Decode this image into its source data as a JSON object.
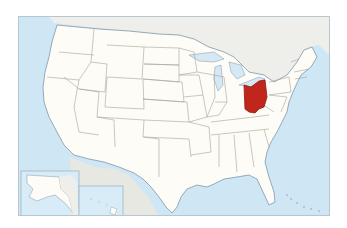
{
  "map": {
    "title": "Ohio in the United States",
    "highlighted_state": "Ohio",
    "colors": {
      "ocean": "#cfe6f5",
      "land_us": "#fdfcf6",
      "land_foreign": "#e8e8e3",
      "canada": "#eeeeea",
      "border": "#a8a39a",
      "coast": "#7f97ab",
      "lakes": "#d6e8f3",
      "highlight": "#c1261c",
      "highlight_border": "#8e1a12",
      "inset_border": "#9fb4c4"
    },
    "insets": [
      {
        "name": "Alaska"
      },
      {
        "name": "Hawaii"
      }
    ]
  }
}
